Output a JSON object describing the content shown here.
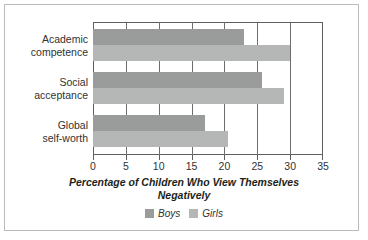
{
  "chart_data": {
    "type": "bar",
    "orientation": "horizontal",
    "title": "",
    "xlabel": "Percentage of Children Who View Themselves Negatively",
    "ylabel": "",
    "xlim": [
      0,
      35
    ],
    "xticks": [
      0,
      5,
      10,
      15,
      20,
      25,
      30,
      35
    ],
    "grid": true,
    "grid_axis": "x",
    "legend_position": "bottom",
    "categories": [
      "Academic competence",
      "Social acceptance",
      "Global self-worth"
    ],
    "category_lines": [
      [
        "Academic",
        "competence"
      ],
      [
        "Social",
        "acceptance"
      ],
      [
        "Global",
        "self-worth"
      ]
    ],
    "series": [
      {
        "name": "Boys",
        "color": "#9a9b9b",
        "values": [
          23,
          25.7,
          17
        ]
      },
      {
        "name": "Girls",
        "color": "#b5b6b6",
        "values": [
          30,
          29,
          20.5
        ]
      }
    ]
  },
  "axis_title_lines": [
    "Percentage of Children Who View Themselves",
    "Negatively"
  ],
  "colors": {
    "boys": "#9a9b9b",
    "girls": "#b5b6b6",
    "axis": "#5d5f60",
    "grid": "#6b6d6e",
    "frame": "#b9bcbc",
    "text": "#303233",
    "background": "#ffffff"
  }
}
